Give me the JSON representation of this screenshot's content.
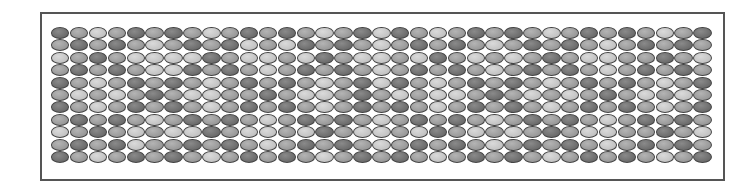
{
  "figure": {
    "columns": 35,
    "rows": 11,
    "shade_colors": {
      "D": "#6e6e6e",
      "M": "#9c9c9c",
      "L": "#cacaca"
    },
    "outline_color": "#444444",
    "frame_color": "#555555",
    "grid": [
      "DMLMDMDMLMDMDMLMDLDMLMDMDMLMDMDMLMD",
      "MDMDMLMDMDLMLDMDMLMDMDMLMDMDMLMDMDM",
      "LMDMLLLLDMLLMLDMLLMLDMLMLMDMLLMMDML",
      "MDMDMLLDMDMLMDMDMLMDMDMLMDMDMLMDMDM",
      "DMLMDMDMLMDMDMLMDLDMLMDMDMLMDMDMLMD",
      "MLMLMDMLLMMDMLLMDMLMLLMDMLMLMDMLMLM",
      "DMLMDMDMLMDMDMLMDMDMLMDMDMLMDMDMLMD",
      "MDMDMLMDMDMLMDMDMLMDMDMLMDMDMLMDMDM",
      "LMDMLMLLDMLLMLDMLLMLDMLMLMDMLLMMDML",
      "MDMDLMMDMDMLMDMDMLMDMDMLMDMDMLMDMDM",
      "DMLMDMDMLMDMDMLMDMDMLMDMDMLMDMDMLMD"
    ]
  }
}
